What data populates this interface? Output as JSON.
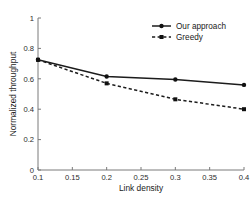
{
  "chart_data": {
    "type": "line",
    "title": "",
    "xlabel": "Link density",
    "ylabel": "Normalized throughput",
    "xlim": [
      0.1,
      0.4
    ],
    "ylim": [
      0,
      1
    ],
    "xticks": [
      "0.1",
      "0.15",
      "0.2",
      "0.25",
      "0.3",
      "0.35",
      "0.4"
    ],
    "xtick_values": [
      0.1,
      0.15,
      0.2,
      0.25,
      0.3,
      0.35,
      0.4
    ],
    "yticks": [
      "0",
      "0.2",
      "0.4",
      "0.6",
      "0.8",
      "1"
    ],
    "ytick_values": [
      0,
      0.2,
      0.4,
      0.6,
      0.8,
      1
    ],
    "grid": false,
    "legend_position": "top-right",
    "x": [
      0.1,
      0.2,
      0.3,
      0.4
    ],
    "series": [
      {
        "name": "Our approach",
        "values": [
          0.725,
          0.615,
          0.595,
          0.56
        ],
        "linestyle": "solid",
        "marker": "circle",
        "color": "#1c1c1c"
      },
      {
        "name": "Greedy",
        "values": [
          0.725,
          0.57,
          0.465,
          0.4
        ],
        "linestyle": "dashed",
        "marker": "square",
        "color": "#1c1c1c"
      }
    ]
  },
  "legend": {
    "entries": [
      {
        "label": "Our approach"
      },
      {
        "label": "Greedy"
      }
    ]
  },
  "axes": {
    "x_label": "Link density",
    "y_label": "Normalized throughput"
  }
}
